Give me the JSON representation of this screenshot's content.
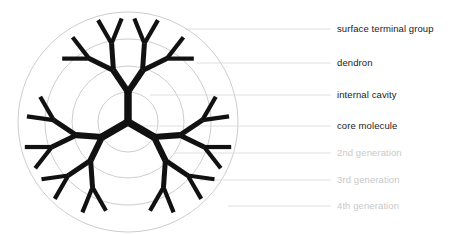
{
  "figure": {
    "type": "diagram",
    "background_color": "#ffffff",
    "structure_color": "#111111",
    "guide_circle_color": "#b8b8b8",
    "leader_line_color": "#d8d8d8",
    "core": {
      "x": 128,
      "y": 122,
      "name": "core molecule"
    },
    "generations": 4,
    "branch_multiplicity": 2,
    "core_arms": 3,
    "generation_radii": [
      30,
      56,
      83,
      110
    ],
    "guide_circle_radii": [
      30,
      56,
      83,
      110
    ],
    "core_arm_angles_deg": [
      -90,
      30,
      150
    ],
    "branch_spread_deg": [
      34,
      30,
      26,
      22
    ],
    "strut_widths_px": [
      7.5,
      6.2,
      5.0,
      4.2
    ]
  },
  "labels": [
    {
      "id": "surface-terminal-group",
      "text": "surface terminal group",
      "style": "dark",
      "text_x": 337,
      "text_y": 24,
      "leader_x1": 185,
      "leader_x2": 331,
      "leader_y": 29
    },
    {
      "id": "dendron",
      "text": "dendron",
      "style": "dark",
      "text_x": 337,
      "text_y": 58,
      "leader_x1": 196,
      "leader_x2": 331,
      "leader_y": 63
    },
    {
      "id": "internal-cavity",
      "text": "internal cavity",
      "style": "dark",
      "text_x": 337,
      "text_y": 90,
      "leader_x1": 150,
      "leader_x2": 331,
      "leader_y": 95
    },
    {
      "id": "core-molecule",
      "text": "core molecule",
      "style": "dark",
      "text_x": 337,
      "text_y": 121,
      "leader_x1": 130,
      "leader_x2": 331,
      "leader_y": 126
    },
    {
      "id": "2nd-generation",
      "text": "2nd generation",
      "style": "muted",
      "text_x": 337,
      "text_y": 148,
      "leader_x1": 175,
      "leader_x2": 331,
      "leader_y": 153
    },
    {
      "id": "3rd-generation",
      "text": "3rd generation",
      "style": "muted",
      "text_x": 337,
      "text_y": 175,
      "leader_x1": 200,
      "leader_x2": 331,
      "leader_y": 180
    },
    {
      "id": "4th-generation",
      "text": "4th generation",
      "style": "muted",
      "text_x": 337,
      "text_y": 201,
      "leader_x1": 228,
      "leader_x2": 331,
      "leader_y": 206
    }
  ]
}
